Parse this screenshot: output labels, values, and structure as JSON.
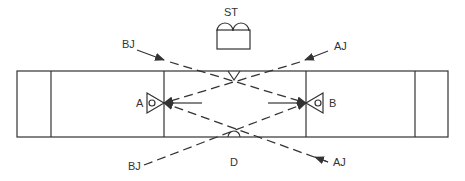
{
  "diagram": {
    "labels": {
      "st": "ST",
      "a": "A",
      "b": "B",
      "d": "D",
      "bj_top": "BJ",
      "aj_top": "AJ",
      "bj_bottom": "BJ",
      "aj_bottom": "AJ"
    },
    "colors": {
      "line": "#333333",
      "background": "#ffffff"
    }
  }
}
